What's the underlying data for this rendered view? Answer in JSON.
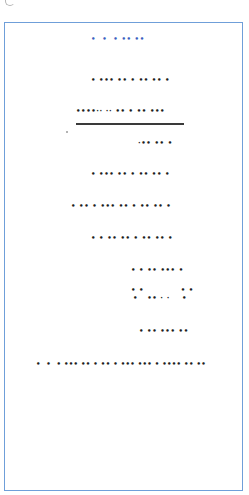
{
  "document": {
    "corner_icon": "partial-circle-icon",
    "border_color": "#6f9fd9",
    "header": {
      "text": "•  •  • •• ••",
      "color": "#3b5fc0"
    },
    "lines": [
      {
        "text": "• ••• •• • •• •• •"
      },
      {
        "text": "••••·· ·· •• • •• •••"
      },
      {
        "text": "·•• •• •"
      },
      {
        "text": "• ••• •• • •• •• •"
      },
      {
        "text": "• •• • ••• •• • •• •• •"
      },
      {
        "text": "• • •• •• • •• •• •"
      },
      {
        "text": "• • •• ••• •"
      },
      {
        "text": "• •            • •"
      },
      {
        "text": "•   •• · ·    •"
      },
      {
        "text": "• •• ••• ••"
      },
      {
        "text": "•  •  • ••• •• • •• • ••• ••• • •••• •• ••"
      }
    ]
  }
}
